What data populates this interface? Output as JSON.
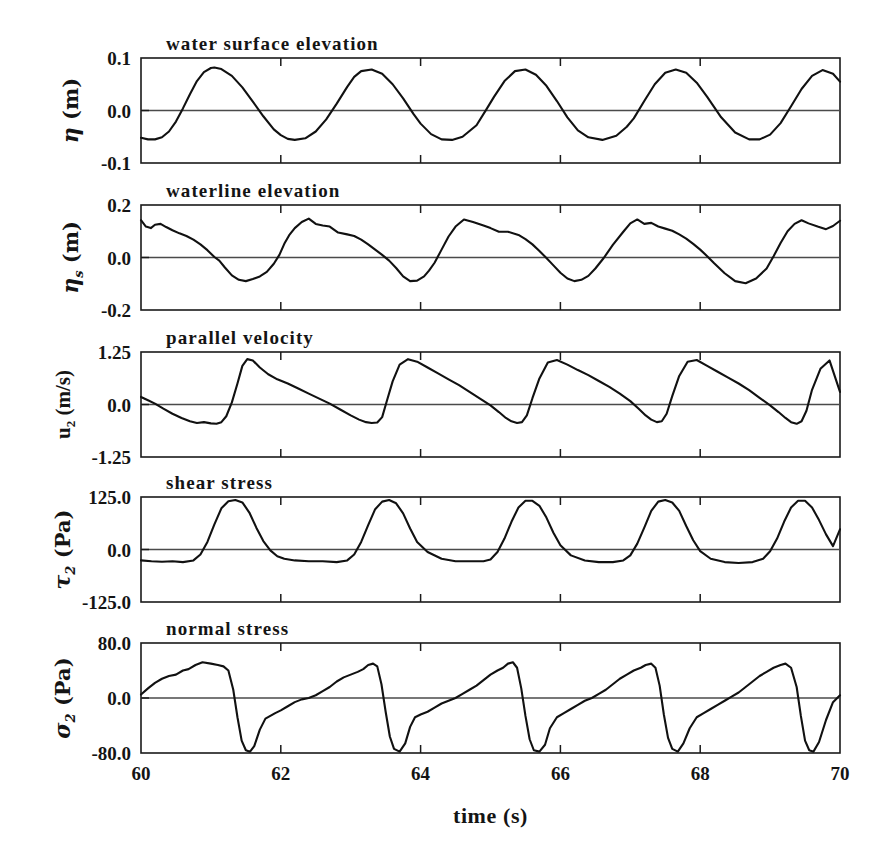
{
  "figure": {
    "background": "#ffffff",
    "line_color": "#111111",
    "axis_color": "#1a1a1a",
    "xlabel": "time (s)"
  },
  "chart_data": [
    {
      "type": "line",
      "title": "water surface elevation",
      "ylabel": "η (m)",
      "ylabel_symbol": "η",
      "ylabel_sub": "",
      "ylabel_unit": "(m)",
      "xlabel": "time (s)",
      "xlim": [
        60,
        70
      ],
      "ylim": [
        -0.1,
        0.1
      ],
      "yticks": [
        0.1,
        0.0,
        -0.1
      ],
      "ytick_labels": [
        "0.1",
        "0.0",
        "-0.1"
      ],
      "xticks": [
        60,
        62,
        64,
        66,
        68,
        70
      ],
      "xtick_labels": [
        "60",
        "62",
        "64",
        "66",
        "68",
        "70"
      ],
      "grid": false,
      "zero_line": true,
      "legend": null,
      "x": [
        60.0,
        60.1,
        60.2,
        60.3,
        60.4,
        60.5,
        60.6,
        60.7,
        60.8,
        60.9,
        61.0,
        61.05,
        61.15,
        61.3,
        61.45,
        61.6,
        61.75,
        61.9,
        62.0,
        62.1,
        62.2,
        62.35,
        62.5,
        62.65,
        62.8,
        62.95,
        63.05,
        63.15,
        63.3,
        63.45,
        63.6,
        63.75,
        63.9,
        64.0,
        64.15,
        64.3,
        64.45,
        64.6,
        64.8,
        64.95,
        65.05,
        65.2,
        65.35,
        65.5,
        65.65,
        65.8,
        65.95,
        66.1,
        66.25,
        66.4,
        66.6,
        66.8,
        66.95,
        67.05,
        67.2,
        67.35,
        67.5,
        67.65,
        67.8,
        67.95,
        68.1,
        68.3,
        68.5,
        68.7,
        68.85,
        69.0,
        69.15,
        69.3,
        69.45,
        69.6,
        69.75,
        69.9,
        70.0
      ],
      "y": [
        -0.052,
        -0.055,
        -0.055,
        -0.051,
        -0.04,
        -0.021,
        0.004,
        0.031,
        0.056,
        0.073,
        0.081,
        0.082,
        0.079,
        0.066,
        0.044,
        0.017,
        -0.011,
        -0.036,
        -0.047,
        -0.054,
        -0.056,
        -0.053,
        -0.04,
        -0.017,
        0.013,
        0.045,
        0.064,
        0.075,
        0.078,
        0.07,
        0.05,
        0.023,
        -0.007,
        -0.025,
        -0.045,
        -0.055,
        -0.056,
        -0.05,
        -0.028,
        0.004,
        0.026,
        0.056,
        0.075,
        0.078,
        0.068,
        0.047,
        0.018,
        -0.013,
        -0.038,
        -0.051,
        -0.056,
        -0.048,
        -0.031,
        -0.015,
        0.018,
        0.05,
        0.072,
        0.078,
        0.072,
        0.053,
        0.026,
        -0.013,
        -0.042,
        -0.055,
        -0.055,
        -0.046,
        -0.024,
        0.008,
        0.041,
        0.066,
        0.077,
        0.07,
        0.055
      ]
    },
    {
      "type": "line",
      "title": "waterline elevation",
      "ylabel": "η_s (m)",
      "ylabel_symbol": "η",
      "ylabel_sub": "s",
      "ylabel_unit": "(m)",
      "xlabel": "time (s)",
      "xlim": [
        60,
        70
      ],
      "ylim": [
        -0.2,
        0.2
      ],
      "yticks": [
        0.2,
        0.0,
        -0.2
      ],
      "ytick_labels": [
        "0.2",
        "0.0",
        "-0.2"
      ],
      "xticks": [
        60,
        62,
        64,
        66,
        68,
        70
      ],
      "xtick_labels": [
        "60",
        "62",
        "64",
        "66",
        "68",
        "70"
      ],
      "grid": false,
      "zero_line": true,
      "legend": null,
      "x": [
        60.0,
        60.07,
        60.14,
        60.2,
        60.28,
        60.36,
        60.45,
        60.55,
        60.65,
        60.75,
        60.85,
        60.95,
        61.05,
        61.12,
        61.2,
        61.3,
        61.4,
        61.5,
        61.6,
        61.7,
        61.8,
        61.9,
        61.98,
        62.05,
        62.12,
        62.2,
        62.3,
        62.4,
        62.5,
        62.6,
        62.7,
        62.82,
        62.95,
        63.05,
        63.15,
        63.25,
        63.35,
        63.45,
        63.55,
        63.65,
        63.75,
        63.85,
        63.95,
        64.05,
        64.12,
        64.2,
        64.3,
        64.4,
        64.5,
        64.62,
        64.75,
        64.9,
        65.0,
        65.12,
        65.25,
        65.4,
        65.5,
        65.6,
        65.7,
        65.8,
        65.9,
        66.0,
        66.1,
        66.2,
        66.3,
        66.4,
        66.5,
        66.62,
        66.75,
        66.9,
        67.0,
        67.1,
        67.2,
        67.3,
        67.4,
        67.5,
        67.6,
        67.7,
        67.8,
        67.9,
        68.0,
        68.1,
        68.2,
        68.35,
        68.5,
        68.65,
        68.8,
        68.95,
        69.05,
        69.15,
        69.25,
        69.35,
        69.45,
        69.55,
        69.68,
        69.8,
        69.9,
        70.0
      ],
      "y": [
        0.142,
        0.118,
        0.112,
        0.125,
        0.128,
        0.116,
        0.104,
        0.092,
        0.082,
        0.068,
        0.05,
        0.028,
        0.002,
        -0.012,
        -0.038,
        -0.068,
        -0.085,
        -0.09,
        -0.082,
        -0.072,
        -0.055,
        -0.024,
        0.01,
        0.052,
        0.085,
        0.112,
        0.135,
        0.148,
        0.128,
        0.122,
        0.118,
        0.095,
        0.088,
        0.082,
        0.068,
        0.05,
        0.03,
        0.01,
        -0.012,
        -0.04,
        -0.072,
        -0.09,
        -0.088,
        -0.072,
        -0.05,
        -0.02,
        0.03,
        0.08,
        0.118,
        0.145,
        0.135,
        0.122,
        0.112,
        0.098,
        0.098,
        0.086,
        0.07,
        0.05,
        0.025,
        -0.002,
        -0.03,
        -0.058,
        -0.08,
        -0.09,
        -0.085,
        -0.07,
        -0.042,
        -0.002,
        0.048,
        0.098,
        0.13,
        0.145,
        0.128,
        0.132,
        0.118,
        0.11,
        0.102,
        0.088,
        0.072,
        0.052,
        0.03,
        0.005,
        -0.022,
        -0.06,
        -0.09,
        -0.098,
        -0.08,
        -0.042,
        0.005,
        0.055,
        0.1,
        0.128,
        0.142,
        0.13,
        0.118,
        0.108,
        0.12,
        0.14
      ]
    },
    {
      "type": "line",
      "title": "parallel velocity",
      "ylabel": "u_2 (m/s)",
      "ylabel_symbol": "u",
      "ylabel_sub": "2",
      "ylabel_unit": "(m/s)",
      "xlabel": "time (s)",
      "xlim": [
        60,
        70
      ],
      "ylim": [
        -1.25,
        1.25
      ],
      "yticks": [
        1.25,
        0.0,
        -1.25
      ],
      "ytick_labels": [
        "1.25",
        "0.0",
        "-1.25"
      ],
      "xticks": [
        60,
        62,
        64,
        66,
        68,
        70
      ],
      "xtick_labels": [
        "60",
        "62",
        "64",
        "66",
        "68",
        "70"
      ],
      "grid": false,
      "zero_line": true,
      "legend": null,
      "x": [
        60.0,
        60.1,
        60.2,
        60.32,
        60.45,
        60.58,
        60.7,
        60.8,
        60.9,
        61.0,
        61.08,
        61.15,
        61.22,
        61.3,
        61.38,
        61.45,
        61.52,
        61.6,
        61.7,
        61.82,
        61.95,
        62.1,
        62.25,
        62.4,
        62.55,
        62.7,
        62.85,
        63.0,
        63.12,
        63.22,
        63.3,
        63.38,
        63.45,
        63.52,
        63.6,
        63.7,
        63.82,
        63.95,
        64.1,
        64.25,
        64.4,
        64.55,
        64.7,
        64.85,
        65.0,
        65.12,
        65.22,
        65.3,
        65.38,
        65.45,
        65.52,
        65.6,
        65.7,
        65.82,
        65.95,
        66.1,
        66.25,
        66.4,
        66.55,
        66.7,
        66.85,
        67.0,
        67.12,
        67.22,
        67.3,
        67.38,
        67.45,
        67.52,
        67.6,
        67.7,
        67.82,
        67.95,
        68.1,
        68.25,
        68.4,
        68.55,
        68.7,
        68.85,
        69.0,
        69.12,
        69.22,
        69.3,
        69.38,
        69.45,
        69.52,
        69.6,
        69.72,
        69.85,
        70.0
      ],
      "y": [
        0.18,
        0.1,
        0.02,
        -0.1,
        -0.22,
        -0.32,
        -0.4,
        -0.44,
        -0.42,
        -0.45,
        -0.46,
        -0.42,
        -0.28,
        0.05,
        0.5,
        0.92,
        1.08,
        1.05,
        0.88,
        0.72,
        0.6,
        0.5,
        0.38,
        0.26,
        0.14,
        0.02,
        -0.12,
        -0.26,
        -0.36,
        -0.42,
        -0.44,
        -0.43,
        -0.3,
        0.1,
        0.55,
        0.95,
        1.08,
        1.02,
        0.88,
        0.74,
        0.6,
        0.46,
        0.3,
        0.14,
        -0.02,
        -0.18,
        -0.32,
        -0.4,
        -0.44,
        -0.42,
        -0.26,
        0.15,
        0.62,
        1.0,
        1.06,
        0.95,
        0.82,
        0.7,
        0.56,
        0.42,
        0.26,
        0.08,
        -0.1,
        -0.26,
        -0.36,
        -0.42,
        -0.4,
        -0.22,
        0.2,
        0.68,
        1.02,
        1.06,
        0.92,
        0.78,
        0.64,
        0.5,
        0.34,
        0.16,
        -0.02,
        -0.18,
        -0.32,
        -0.42,
        -0.46,
        -0.4,
        -0.15,
        0.35,
        0.85,
        1.05,
        0.3
      ]
    },
    {
      "type": "line",
      "title": "shear stress",
      "ylabel": "τ_2 (Pa)",
      "ylabel_symbol": "τ",
      "ylabel_sub": "2",
      "ylabel_unit": "(Pa)",
      "xlabel": "time (s)",
      "xlim": [
        60,
        70
      ],
      "ylim": [
        -125.0,
        125.0
      ],
      "yticks": [
        125.0,
        0.0,
        -125.0
      ],
      "ytick_labels": [
        "125.0",
        "0.0",
        "-125.0"
      ],
      "xticks": [
        60,
        62,
        64,
        66,
        68,
        70
      ],
      "xtick_labels": [
        "60",
        "62",
        "64",
        "66",
        "68",
        "70"
      ],
      "grid": false,
      "zero_line": true,
      "legend": null,
      "x": [
        60.0,
        60.15,
        60.3,
        60.45,
        60.6,
        60.75,
        60.85,
        60.95,
        61.05,
        61.15,
        61.25,
        61.35,
        61.45,
        61.55,
        61.65,
        61.75,
        61.85,
        61.95,
        62.05,
        62.2,
        62.4,
        62.6,
        62.8,
        62.95,
        63.05,
        63.15,
        63.25,
        63.35,
        63.45,
        63.55,
        63.65,
        63.75,
        63.85,
        63.95,
        64.1,
        64.3,
        64.5,
        64.7,
        64.9,
        65.0,
        65.1,
        65.2,
        65.3,
        65.4,
        65.5,
        65.6,
        65.7,
        65.8,
        65.9,
        66.0,
        66.15,
        66.35,
        66.55,
        66.75,
        66.9,
        67.0,
        67.1,
        67.2,
        67.3,
        67.4,
        67.5,
        67.6,
        67.7,
        67.8,
        67.9,
        68.0,
        68.15,
        68.35,
        68.55,
        68.75,
        68.9,
        69.0,
        69.1,
        69.2,
        69.3,
        69.4,
        69.5,
        69.6,
        69.7,
        69.8,
        69.9,
        70.0
      ],
      "y": [
        -26,
        -28,
        -29,
        -28,
        -30,
        -26,
        -12,
        18,
        60,
        98,
        115,
        118,
        112,
        88,
        52,
        20,
        -2,
        -16,
        -22,
        -26,
        -28,
        -28,
        -30,
        -26,
        -12,
        18,
        58,
        96,
        114,
        118,
        110,
        86,
        50,
        18,
        -6,
        -22,
        -28,
        -28,
        -28,
        -24,
        -6,
        26,
        66,
        100,
        116,
        116,
        104,
        76,
        40,
        10,
        -14,
        -26,
        -30,
        -30,
        -26,
        -14,
        14,
        52,
        92,
        114,
        118,
        112,
        92,
        56,
        22,
        -4,
        -22,
        -30,
        -32,
        -30,
        -22,
        -4,
        26,
        66,
        100,
        116,
        116,
        100,
        70,
        36,
        8,
        48
      ]
    },
    {
      "type": "line",
      "title": "normal stress",
      "ylabel": "σ_2 (Pa)",
      "ylabel_symbol": "σ",
      "ylabel_sub": "2",
      "ylabel_unit": "(Pa)",
      "xlabel": "time (s)",
      "xlim": [
        60,
        70
      ],
      "ylim": [
        -80.0,
        80.0
      ],
      "yticks": [
        80.0,
        0.0,
        -80.0
      ],
      "ytick_labels": [
        "80.0",
        "0.0",
        "-80.0"
      ],
      "xticks": [
        60,
        62,
        64,
        66,
        68,
        70
      ],
      "xtick_labels": [
        "60",
        "62",
        "64",
        "66",
        "68",
        "70"
      ],
      "grid": false,
      "zero_line": true,
      "legend": null,
      "x": [
        60.0,
        60.1,
        60.2,
        60.3,
        60.4,
        60.5,
        60.6,
        60.68,
        60.78,
        60.88,
        61.0,
        61.1,
        61.18,
        61.25,
        61.32,
        61.38,
        61.44,
        61.5,
        61.56,
        61.62,
        61.7,
        61.78,
        61.85,
        61.92,
        62.0,
        62.1,
        62.2,
        62.3,
        62.4,
        62.5,
        62.6,
        62.7,
        62.8,
        62.9,
        63.0,
        63.1,
        63.18,
        63.25,
        63.32,
        63.38,
        63.44,
        63.5,
        63.56,
        63.62,
        63.7,
        63.78,
        63.85,
        63.92,
        64.0,
        64.1,
        64.2,
        64.3,
        64.4,
        64.5,
        64.6,
        64.7,
        64.8,
        64.9,
        65.0,
        65.1,
        65.18,
        65.25,
        65.32,
        65.38,
        65.44,
        65.5,
        65.56,
        65.62,
        65.7,
        65.78,
        65.85,
        65.95,
        66.05,
        66.15,
        66.25,
        66.35,
        66.45,
        66.55,
        66.65,
        66.75,
        66.85,
        66.95,
        67.05,
        67.15,
        67.22,
        67.3,
        67.36,
        67.42,
        67.48,
        67.54,
        67.6,
        67.68,
        67.76,
        67.85,
        67.95,
        68.05,
        68.15,
        68.25,
        68.35,
        68.45,
        68.55,
        68.65,
        68.75,
        68.85,
        68.95,
        69.05,
        69.15,
        69.22,
        69.3,
        69.38,
        69.44,
        69.5,
        69.56,
        69.62,
        69.7,
        69.8,
        69.9,
        70.0
      ],
      "y": [
        5,
        14,
        22,
        28,
        32,
        34,
        40,
        42,
        48,
        52,
        50,
        48,
        46,
        40,
        12,
        -28,
        -62,
        -76,
        -78,
        -70,
        -46,
        -30,
        -26,
        -22,
        -18,
        -12,
        -6,
        -2,
        0,
        4,
        10,
        16,
        24,
        30,
        34,
        38,
        42,
        48,
        50,
        46,
        20,
        -20,
        -56,
        -74,
        -78,
        -66,
        -42,
        -28,
        -24,
        -20,
        -14,
        -8,
        -4,
        0,
        6,
        12,
        18,
        26,
        34,
        40,
        44,
        50,
        52,
        44,
        14,
        -26,
        -60,
        -76,
        -78,
        -68,
        -44,
        -28,
        -22,
        -16,
        -10,
        -4,
        0,
        6,
        12,
        20,
        28,
        34,
        40,
        44,
        48,
        50,
        44,
        18,
        -24,
        -58,
        -74,
        -78,
        -66,
        -44,
        -28,
        -22,
        -16,
        -10,
        -4,
        2,
        8,
        16,
        24,
        32,
        38,
        44,
        48,
        50,
        44,
        16,
        -26,
        -62,
        -76,
        -78,
        -64,
        -32,
        -6,
        4
      ]
    }
  ]
}
